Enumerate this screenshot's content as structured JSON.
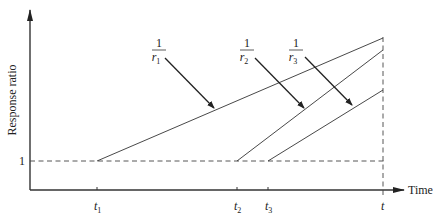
{
  "diagram": {
    "y_axis_label": "Response ratio",
    "x_axis_label": "Time",
    "baseline_label": "1",
    "ticks": [
      {
        "name": "t1",
        "base": "t",
        "sub": "1",
        "x": 97
      },
      {
        "name": "t2",
        "base": "t",
        "sub": "2",
        "x": 237
      },
      {
        "name": "t3",
        "base": "t",
        "sub": "3",
        "x": 268
      },
      {
        "name": "t",
        "base": "t",
        "sub": "",
        "x": 383
      }
    ],
    "lines": [
      {
        "name": "job-1",
        "start_tick": "t1",
        "slope_label_num": "1",
        "slope_label_den": "r",
        "slope_label_sub": "1"
      },
      {
        "name": "job-2",
        "start_tick": "t2",
        "slope_label_num": "1",
        "slope_label_den": "r",
        "slope_label_sub": "2"
      },
      {
        "name": "job-3",
        "start_tick": "t3",
        "slope_label_num": "1",
        "slope_label_den": "r",
        "slope_label_sub": "3"
      }
    ],
    "colors": {
      "line": "#333333",
      "arrow": "#222222",
      "background": "#ffffff"
    }
  }
}
